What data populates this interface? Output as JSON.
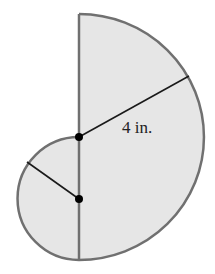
{
  "figure": {
    "large_semicircle": {
      "radius_label": "4 in."
    },
    "small_semicircle": {
      "radius_label": ""
    },
    "colors": {
      "fill": "#e6e6e6",
      "outline": "#707070",
      "radius_line": "#1a1a1a",
      "dot": "#000000"
    }
  }
}
